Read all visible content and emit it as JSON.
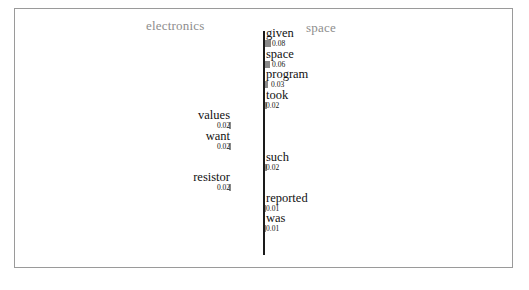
{
  "chart_data": {
    "type": "bar",
    "orientation": "horizontal-diverging",
    "title": "",
    "xlabel": "",
    "ylabel": "",
    "grid": false,
    "axis_center": 0,
    "class_left": "electronics",
    "class_right": "space",
    "legend_position": "top",
    "categories": [
      "given",
      "space",
      "program",
      "took",
      "values",
      "want",
      "such",
      "resistor",
      "reported",
      "was"
    ],
    "values": [
      0.08,
      0.06,
      0.03,
      0.02,
      -0.02,
      -0.02,
      0.02,
      -0.02,
      0.01,
      0.01
    ],
    "labels": [
      "0.08",
      "0.06",
      "0.03",
      "0.02",
      "0.02",
      "0.02",
      "0.02",
      "0.02",
      "0.01",
      "0.01"
    ],
    "bars": [
      {
        "word": "given",
        "value": 0.08,
        "label": "0.08",
        "side": "right",
        "bar_px": 6
      },
      {
        "word": "space",
        "value": 0.06,
        "label": "0.06",
        "side": "right",
        "bar_px": 5
      },
      {
        "word": "program",
        "value": 0.03,
        "label": "0.03",
        "side": "right",
        "bar_px": 3
      },
      {
        "word": "took",
        "value": 0.02,
        "label": "0.02",
        "side": "right",
        "bar_px": 2
      },
      {
        "word": "values",
        "value": -0.02,
        "label": "0.02",
        "side": "left",
        "bar_px": 2
      },
      {
        "word": "want",
        "value": -0.02,
        "label": "0.02",
        "side": "left",
        "bar_px": 2
      },
      {
        "word": "such",
        "value": 0.02,
        "label": "0.02",
        "side": "right",
        "bar_px": 2
      },
      {
        "word": "resistor",
        "value": -0.02,
        "label": "0.02",
        "side": "left",
        "bar_px": 2
      },
      {
        "word": "reported",
        "value": 0.01,
        "label": "0.01",
        "side": "right",
        "bar_px": 1
      },
      {
        "word": "was",
        "value": 0.01,
        "label": "0.01",
        "side": "right",
        "bar_px": 1
      }
    ]
  },
  "colors": {
    "bar": "#8a8a8a",
    "axis": "#1a1a1a",
    "header_text": "#8d8d8d",
    "label_text": "#111111",
    "frame": "#9a9a9a",
    "background": "#ffffff"
  }
}
